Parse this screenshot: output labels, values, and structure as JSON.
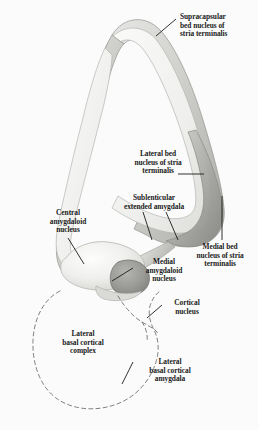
{
  "figure": {
    "background_color": "#fbfbfb",
    "ink_color": "#1b1b1b",
    "shading": {
      "pale": "#f0f0ee",
      "light_gray": "#dcdcda",
      "mid_gray": "#b9b9b6",
      "dark_gray": "#8e8e8b",
      "outline": "#9a9a97",
      "dashed_outline": "#6f6f6d"
    }
  },
  "labels": [
    {
      "id": "supracapsular-bed-nucleus",
      "text": "Supracapsular\nbed nucleus of\nstria terminalis",
      "x": 180,
      "y": 13,
      "width": 74,
      "align": "left",
      "leader": "diagonal-up-left"
    },
    {
      "id": "lateral-bed-nucleus",
      "text": "Lateral bed\nnucleus of stria\nterminalis",
      "x": 122,
      "y": 150,
      "width": 74,
      "align": "center",
      "leader": "horizontal-right"
    },
    {
      "id": "sublenticular-extended-amygdala",
      "text": "Sublenticular\nextended amygdala",
      "x": 108,
      "y": 194,
      "width": 90,
      "align": "center",
      "leader": "v-shaped-double"
    },
    {
      "id": "central-amygdaloid-nucleus",
      "text": "Central\namygdaloid\nnucleus",
      "x": 38,
      "y": 209,
      "width": 62,
      "align": "center",
      "leader": "diagonal-down-right"
    },
    {
      "id": "medial-bed-nucleus",
      "text": "Medial bed\nnucleus of stria\nterminalis",
      "x": 183,
      "y": 243,
      "width": 74,
      "align": "center",
      "leader": "vertical-up"
    },
    {
      "id": "medial-amygdaloid-nucleus",
      "text": "Medial\namygdaloid\nnucleus",
      "x": 134,
      "y": 258,
      "width": 60,
      "align": "center",
      "leader": "diagonal-down-left"
    },
    {
      "id": "cortical-nucleus",
      "text": "Cortical\nnucleus",
      "x": 163,
      "y": 299,
      "width": 48,
      "align": "center",
      "leader": "diagonal-down-left"
    },
    {
      "id": "lateral-basal-cortical-complex",
      "text": "Lateral\nbasal cortical\ncomplex",
      "x": 47,
      "y": 330,
      "width": 72,
      "align": "center",
      "leader": "none"
    },
    {
      "id": "lateral-basal-cortical-amygdala",
      "text": "Lateral\nbasal cortical\namygdala",
      "x": 134,
      "y": 358,
      "width": 72,
      "align": "center",
      "leader": "diagonal-up-left"
    }
  ]
}
